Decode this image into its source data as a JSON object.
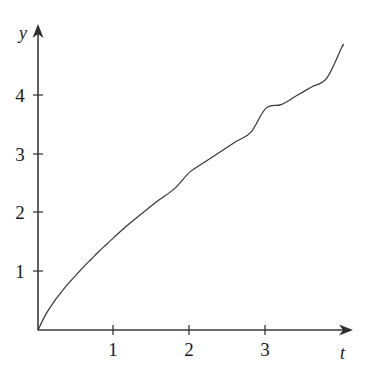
{
  "figure": {
    "background_color": "#ffffff",
    "ink_color": "#3a3a3a",
    "text_color": "#1a1a1a"
  },
  "axes": {
    "x_label": "t",
    "y_label": "y",
    "x_tick_labels": [
      "1",
      "2",
      "3"
    ],
    "y_tick_labels": [
      "1",
      "2",
      "3",
      "4"
    ],
    "x_arrow_icon": "arrow-right-icon",
    "y_arrow_icon": "arrow-up-icon"
  },
  "chart_data": {
    "type": "line",
    "title": "",
    "subtitle": "",
    "xlabel": "t",
    "ylabel": "y",
    "xlim": [
      0,
      4.15
    ],
    "ylim": [
      0,
      5.0
    ],
    "xticks": [
      1,
      2,
      3
    ],
    "yticks": [
      1,
      2,
      3,
      4
    ],
    "grid": false,
    "legend": null,
    "annotations": [],
    "series": [
      {
        "name": "y(t)",
        "color": "#3a3a3a",
        "x": [
          0,
          0.1,
          0.2,
          0.3,
          0.4,
          0.5,
          0.6,
          0.7,
          0.8,
          0.9,
          1.0,
          1.2,
          1.4,
          1.6,
          1.8,
          2.0,
          2.2,
          2.4,
          2.6,
          2.8,
          3.0,
          3.2,
          3.4,
          3.6,
          3.8,
          4.0,
          4.01
        ],
        "values": [
          0,
          0.26,
          0.46,
          0.63,
          0.79,
          0.93,
          1.07,
          1.2,
          1.33,
          1.45,
          1.57,
          1.8,
          2.01,
          2.21,
          2.4,
          2.68,
          2.85,
          3.02,
          3.19,
          3.35,
          3.76,
          3.82,
          3.97,
          4.12,
          4.27,
          4.8,
          4.81
        ]
      }
    ]
  },
  "geometry": {
    "origin_x": 38,
    "origin_y": 330,
    "x_unit_px": 76,
    "y_unit_px": 59
  }
}
